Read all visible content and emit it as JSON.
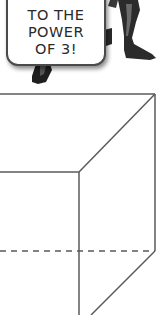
{
  "comic": {
    "speech_bubble": {
      "lines": [
        "TO THE",
        "POWER",
        "OF 3!"
      ]
    },
    "character": "superhero-legs-boots"
  },
  "diagram": {
    "type": "cube-wireframe",
    "line_color": "#5a5a5a",
    "hidden_edge_style": "dashed"
  }
}
